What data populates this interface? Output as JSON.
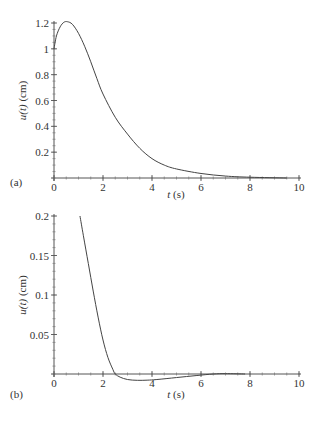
{
  "chart_data": [
    {
      "panel": "(a)",
      "type": "line",
      "title": "",
      "xlabel": "t (s)",
      "ylabel": "u(t) (cm)",
      "xlim": [
        0,
        10
      ],
      "ylim": [
        0,
        1.2
      ],
      "xticks": [
        0,
        2,
        4,
        6,
        8,
        10
      ],
      "yticks": [
        0.2,
        0.4,
        0.6,
        0.8,
        1,
        1.2
      ],
      "ytick_labels": [
        "0.2",
        "0.4",
        "0.6",
        "0.8",
        "1",
        "1.2"
      ],
      "grid": false,
      "series": [
        {
          "name": "u(t)",
          "x": [
            0,
            0.1,
            0.25,
            0.4,
            0.55,
            0.75,
            1.0,
            1.25,
            1.5,
            1.75,
            2.0,
            2.5,
            3.0,
            3.5,
            4.0,
            4.5,
            5.0,
            6.0,
            7.0,
            8.0,
            9.5
          ],
          "y": [
            1.0,
            1.1,
            1.17,
            1.205,
            1.21,
            1.19,
            1.12,
            1.02,
            0.9,
            0.77,
            0.65,
            0.47,
            0.34,
            0.23,
            0.15,
            0.1,
            0.07,
            0.035,
            0.015,
            0.006,
            0.0
          ]
        }
      ]
    },
    {
      "panel": "(b)",
      "type": "line",
      "title": "",
      "xlabel": "t (s)",
      "ylabel": "u(t) (cm)",
      "xlim": [
        0,
        10
      ],
      "ylim": [
        0,
        0.2
      ],
      "xticks": [
        0,
        2,
        4,
        6,
        8,
        10
      ],
      "yticks": [
        0.05,
        0.1,
        0.15,
        0.2
      ],
      "ytick_labels": [
        "0.05",
        "0.1",
        "0.15",
        "0.2"
      ],
      "grid": false,
      "series": [
        {
          "name": "u(t)",
          "x": [
            1.06,
            1.2,
            1.4,
            1.6,
            1.8,
            2.0,
            2.2,
            2.4,
            2.5,
            2.7,
            3.0,
            3.4,
            3.8,
            4.2,
            5.0,
            5.8,
            6.5,
            7.0,
            7.8
          ],
          "y": [
            0.2,
            0.175,
            0.14,
            0.105,
            0.072,
            0.043,
            0.021,
            0.006,
            0.0,
            -0.004,
            -0.007,
            -0.008,
            -0.0078,
            -0.007,
            -0.0045,
            -0.002,
            0.0,
            0.0005,
            0.0
          ]
        }
      ]
    }
  ],
  "panels": {
    "a": {
      "label": "(a)",
      "xlabel_var": "t",
      "xlabel_unit": " (s)",
      "ylabel_var": "u(t)",
      "ylabel_unit": " (cm)"
    },
    "b": {
      "label": "(b)",
      "xlabel_var": "t",
      "xlabel_unit": " (s)",
      "ylabel_var": "u(t)",
      "ylabel_unit": " (cm)"
    }
  }
}
